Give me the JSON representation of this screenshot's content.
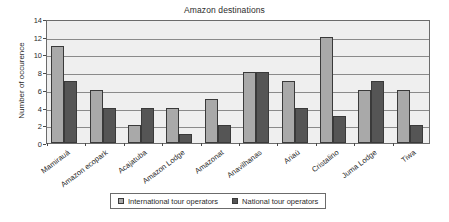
{
  "chart_data": {
    "type": "bar",
    "title": "Amazon destinations",
    "xlabel": "",
    "ylabel": "Number of occurence",
    "ylim": [
      0,
      14
    ],
    "yticks": [
      0,
      2,
      4,
      6,
      8,
      10,
      12,
      14
    ],
    "grid": true,
    "legend_position": "bottom",
    "categories": [
      "Mamirauá",
      "Amazon ecopark",
      "Acajatuba",
      "Amazon Lodge",
      "Amazonat",
      "Anavilhanas",
      "Ariaú",
      "Cristalino",
      "Juma Lodge",
      "Tiwa"
    ],
    "series": [
      {
        "name": "International tour operators",
        "color": "#a9a9a9",
        "values": [
          11,
          6,
          2,
          4,
          5,
          8,
          7,
          12,
          6,
          6
        ]
      },
      {
        "name": "National tour operators",
        "color": "#555555",
        "values": [
          7,
          4,
          4,
          1,
          2,
          8,
          4,
          3,
          7,
          2
        ]
      }
    ]
  },
  "plot": {
    "background_color": "#efefef",
    "border_color": "#6b6b6b"
  }
}
